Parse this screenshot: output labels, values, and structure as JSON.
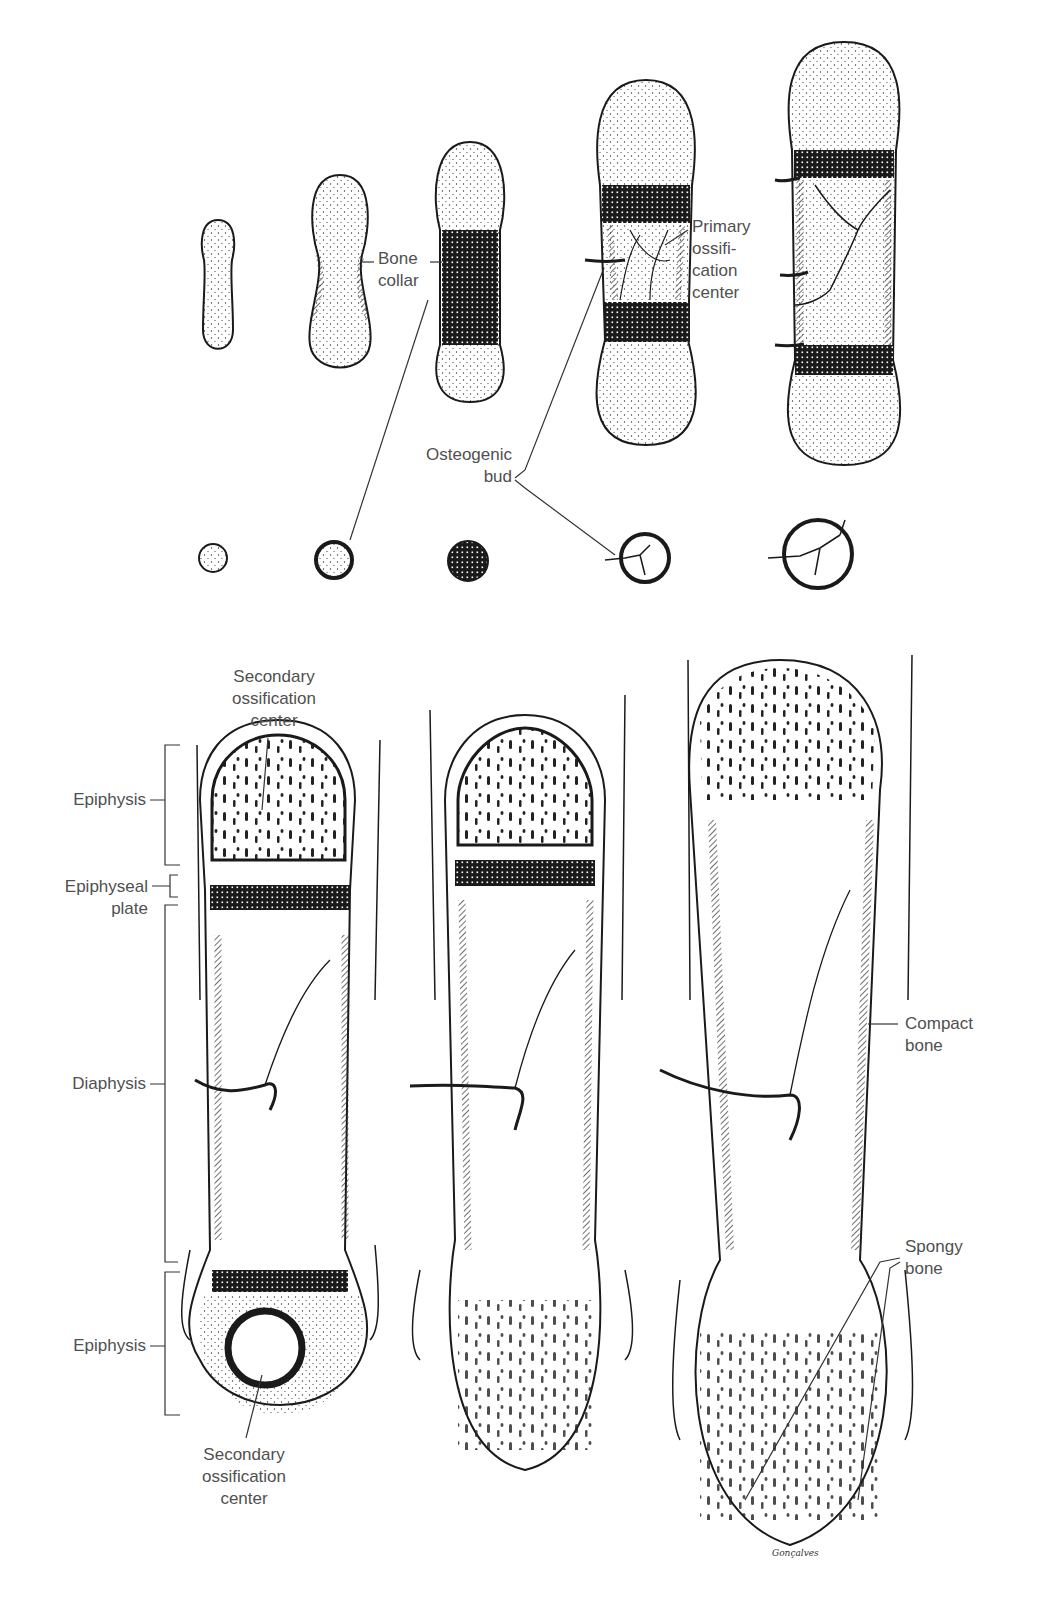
{
  "figure": {
    "top_row": {
      "stages": [
        "stage-1",
        "stage-2",
        "stage-3",
        "stage-4",
        "stage-5"
      ],
      "labels": {
        "bone_collar": [
          "Bone",
          "collar"
        ],
        "primary_ossification_center": [
          "Primary",
          "ossifi-",
          "cation",
          "center"
        ],
        "osteogenic_bud": [
          "Osteogenic",
          "bud"
        ]
      }
    },
    "cross_sections": {
      "count": 5
    },
    "bottom_row": {
      "labels": {
        "secondary_ossification_center_top": [
          "Secondary",
          "ossification",
          "center"
        ],
        "epiphysis_top": "Epiphysis",
        "epiphyseal_plate": [
          "Epiphyseal",
          "plate"
        ],
        "diaphysis": "Diaphysis",
        "epiphysis_bottom": "Epiphysis",
        "secondary_ossification_center_bottom": [
          "Secondary",
          "ossification",
          "center"
        ],
        "compact_bone": [
          "Compact",
          "bone"
        ],
        "spongy_bone": [
          "Spongy",
          "bone"
        ]
      },
      "artist_signature": "Gonçalves"
    },
    "colors": {
      "ink": "#1a1a1a",
      "label_text": "#505050",
      "background": "#ffffff"
    }
  }
}
